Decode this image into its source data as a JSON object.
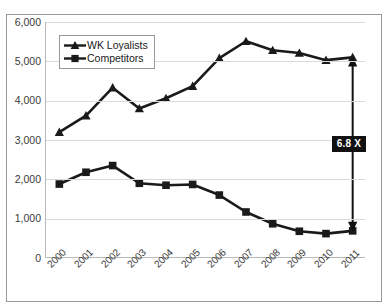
{
  "figure": {
    "background_color": "#ffffff",
    "frame_color": "#9a9a9a",
    "plot_border_color": "#b8b8b8",
    "gridline_color": "#d9d9d9",
    "series_color": "#1a1a1a",
    "callout_background": "#111111",
    "callout_text_color": "#ffffff"
  },
  "legend": {
    "position": "top-left-inside",
    "entries": [
      {
        "label": "WK Loyalists",
        "marker": "triangle-marker",
        "color": "#1a1a1a"
      },
      {
        "label": "Competitors",
        "marker": "square-marker",
        "color": "#1a1a1a"
      }
    ]
  },
  "annotation": {
    "label": "6.8 X",
    "arrow": "double-headed-vertical-arrow",
    "at_category": "2011",
    "from_value": 690,
    "to_value": 5100
  },
  "chart_data": {
    "type": "line",
    "title": "",
    "subtitle": "",
    "xlabel": "",
    "ylabel": "",
    "categories": [
      "2000",
      "2001",
      "2002",
      "2003",
      "2004",
      "2005",
      "2006",
      "2007",
      "2008",
      "2009",
      "2010",
      "2011"
    ],
    "series": [
      {
        "name": "WK Loyalists",
        "marker": "triangle",
        "color": "#1a1a1a",
        "values": [
          3200,
          3620,
          4330,
          3800,
          4060,
          4370,
          5080,
          5510,
          5280,
          5210,
          5030,
          5100
        ]
      },
      {
        "name": "Competitors",
        "marker": "square",
        "color": "#1a1a1a",
        "values": [
          1880,
          2180,
          2350,
          1900,
          1850,
          1870,
          1600,
          1170,
          870,
          680,
          620,
          690
        ]
      }
    ],
    "ylim": [
      0,
      6000
    ],
    "ytick_values": [
      0,
      1000,
      2000,
      3000,
      4000,
      5000,
      6000
    ],
    "ytick_labels": [
      "0",
      "1,000",
      "2,000",
      "3,000",
      "4,000",
      "5,000",
      "6,000"
    ],
    "xtick_labels": [
      "2000",
      "2001",
      "2002",
      "2003",
      "2004",
      "2005",
      "2006",
      "2007",
      "2008",
      "2009",
      "2010",
      "2011"
    ],
    "grid": true,
    "grid_axis": "y",
    "legend_position": "upper left"
  }
}
